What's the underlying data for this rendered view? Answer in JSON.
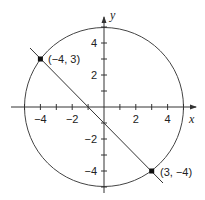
{
  "diagram": {
    "type": "coordinate-plot",
    "axes": {
      "x_label": "x",
      "y_label": "y",
      "x_ticks": [
        {
          "value": -4,
          "label": "−4"
        },
        {
          "value": -2,
          "label": "−2"
        },
        {
          "value": 2,
          "label": "2"
        },
        {
          "value": 4,
          "label": "4"
        }
      ],
      "y_ticks": [
        {
          "value": 4,
          "label": "4"
        },
        {
          "value": 2,
          "label": "2"
        },
        {
          "value": -2,
          "label": "−2"
        },
        {
          "value": -4,
          "label": "−4"
        }
      ]
    },
    "circle": {
      "center": [
        0,
        0
      ],
      "radius": 5
    },
    "line": {
      "equation": "y = -x - 1",
      "through": [
        [
          -4,
          3
        ],
        [
          3,
          -4
        ]
      ]
    },
    "points": [
      {
        "x": -4,
        "y": 3,
        "label": "(−4, 3)"
      },
      {
        "x": 3,
        "y": -4,
        "label": "(3, −4)"
      }
    ]
  }
}
